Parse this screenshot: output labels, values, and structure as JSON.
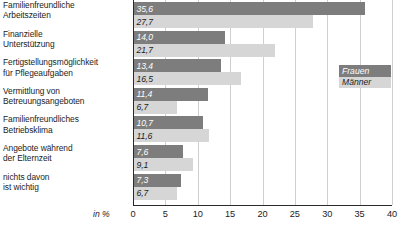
{
  "chart_data": {
    "type": "bar",
    "orientation": "horizontal",
    "title": "",
    "subtitle": "",
    "xlabel": "in %",
    "ylabel": "",
    "xlim": [
      0,
      40
    ],
    "xticks": [
      0,
      5,
      10,
      15,
      20,
      25,
      30,
      35,
      40
    ],
    "xtick_labels": [
      "0",
      "5",
      "10",
      "15",
      "20",
      "25",
      "30",
      "35",
      "40"
    ],
    "grid": true,
    "grid_axis": "x",
    "legend_position": "right",
    "categories": [
      "Familienfreundliche Arbeitszeiten",
      "Finanzielle Unterstützung",
      "Fertigstellungsmöglichkeit für Pflegeaufgaben",
      "Vermittlung von Betreuungsangeboten",
      "Familienfreundliches Betriebsklima",
      "Angebote während der Elternzeit",
      "nichts davon ist wichtig"
    ],
    "category_lines": [
      [
        "Familienfreundliche",
        "Arbeitszeiten"
      ],
      [
        "Finanzielle",
        "Unterstützung"
      ],
      [
        "Fertigstellungsmöglichkeit",
        "für Pflegeaufgaben"
      ],
      [
        "Vermittlung von",
        "Betreuungsangeboten"
      ],
      [
        "Familienfreundliches",
        "Betriebsklima"
      ],
      [
        "Angebote während",
        "der Elternzeit"
      ],
      [
        "nichts davon",
        "ist wichtig"
      ]
    ],
    "series": [
      {
        "name": "Frauen",
        "color": "#7d7d7d",
        "values": [
          35.6,
          14.0,
          13.4,
          11.4,
          10.7,
          7.6,
          7.3
        ],
        "labels": [
          "35,6",
          "14,0",
          "13,4",
          "11,4",
          "10,7",
          "7,6",
          "7,3"
        ]
      },
      {
        "name": "Männer",
        "color": "#d6d6d6",
        "values": [
          27.7,
          21.7,
          16.5,
          6.7,
          11.6,
          9.1,
          6.7
        ],
        "labels": [
          "27,7",
          "21,7",
          "16,5",
          "6,7",
          "11,6",
          "9,1",
          "6,7"
        ]
      }
    ]
  },
  "legend": {
    "items": [
      {
        "label": "Frauen",
        "color": "#7d7d7d"
      },
      {
        "label": "Männer",
        "color": "#d6d6d6"
      }
    ]
  },
  "axis": {
    "unit_label": "in %"
  },
  "colors": {
    "frauen": "#7d7d7d",
    "maenner": "#d6d6d6",
    "gridline": "#cfcfcf",
    "axis": "#2a2a2a",
    "text": "#1c1c1c",
    "background": "#ffffff"
  }
}
